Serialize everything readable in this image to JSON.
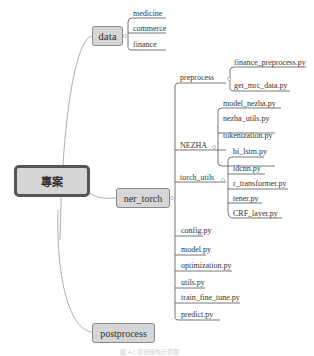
{
  "root": {
    "label": "專案"
  },
  "branches": {
    "data": {
      "label": "data",
      "children": [
        "medicine",
        "commerce",
        "finance"
      ]
    },
    "ner_torch": {
      "label": "ner_torch",
      "groups": {
        "preprocess": {
          "label": "preprocess",
          "children": [
            "finance_preprocess.py",
            "get_mrc_data.py"
          ]
        },
        "nezha": {
          "label": "NEZHA",
          "children": [
            "model_nezha.py",
            "nezha_utils.py",
            "tokenization.py"
          ]
        },
        "torch_utils": {
          "label": "torch_utils",
          "children": [
            "bi_lstm.py",
            "idcnn.py",
            "r_transformer.py",
            "tener.py",
            "CRF_layer.py"
          ]
        }
      },
      "files": [
        "config.py",
        "model.py",
        "optimization.py",
        "utils.py",
        "train_fine_tune.py",
        "predict.py"
      ]
    },
    "postprocess": {
      "label": "postprocess"
    }
  },
  "caption": "图 4-1 项目结构示意图"
}
